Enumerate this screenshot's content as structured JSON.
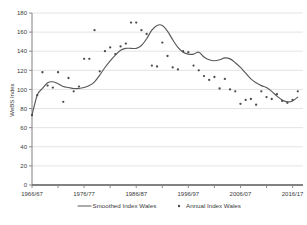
{
  "chart_data": {
    "type": "line",
    "title": "",
    "xlabel": "",
    "ylabel": "WeBS Index",
    "ylim": [
      0,
      180
    ],
    "ytick_values": [
      0,
      20,
      40,
      60,
      80,
      100,
      120,
      140,
      160,
      180
    ],
    "ytick_labels": [
      "0",
      "20",
      "40",
      "60",
      "80",
      "100",
      "120",
      "140",
      "160",
      "180"
    ],
    "xtick_labels": [
      "1966/67",
      "1976/77",
      "1986/87",
      "1996/97",
      "2006/07",
      "2016/17"
    ],
    "xtick_years": [
      1966,
      1976,
      1986,
      1996,
      2006,
      2016
    ],
    "xlim": [
      1966,
      2018
    ],
    "grid": "horizontal",
    "legend_position": "bottom",
    "legend": [
      {
        "label": "Smoothed Index Wales",
        "type": "line",
        "color": "#595959"
      },
      {
        "label": "Annual Index Wales",
        "type": "marker",
        "color": "#4d4d4d"
      }
    ],
    "series": [
      {
        "name": "Smoothed Index Wales",
        "type": "line",
        "x": [
          1966,
          1967,
          1968,
          1969,
          1970,
          1971,
          1972,
          1973,
          1974,
          1975,
          1976,
          1977,
          1978,
          1979,
          1980,
          1981,
          1982,
          1983,
          1984,
          1985,
          1986,
          1987,
          1988,
          1989,
          1990,
          1991,
          1992,
          1993,
          1994,
          1995,
          1996,
          1997,
          1998,
          1999,
          2000,
          2001,
          2002,
          2003,
          2004,
          2005,
          2006,
          2007,
          2008,
          2009,
          2010,
          2011,
          2012,
          2013,
          2014,
          2015,
          2016,
          2017
        ],
        "values": [
          73,
          94,
          101,
          107,
          108,
          106,
          103,
          102,
          101,
          101,
          102,
          104,
          108,
          115,
          123,
          130,
          136,
          141,
          143,
          143,
          143,
          146,
          153,
          162,
          167,
          167,
          161,
          152,
          144,
          139,
          137,
          137,
          139,
          134,
          131,
          130,
          131,
          133,
          132,
          128,
          123,
          117,
          111,
          107,
          104,
          102,
          98,
          93,
          89,
          87,
          88,
          92
        ]
      },
      {
        "name": "Annual Index Wales",
        "type": "scatter",
        "x": [
          1966,
          1967,
          1968,
          1969,
          1970,
          1971,
          1972,
          1973,
          1974,
          1975,
          1976,
          1977,
          1978,
          1979,
          1980,
          1981,
          1982,
          1983,
          1984,
          1985,
          1986,
          1987,
          1988,
          1989,
          1990,
          1991,
          1992,
          1993,
          1994,
          1995,
          1996,
          1997,
          1998,
          1999,
          2000,
          2001,
          2002,
          2003,
          2004,
          2005,
          2006,
          2007,
          2008,
          2009,
          2010,
          2011,
          2012,
          2013,
          2014,
          2015,
          2016,
          2017
        ],
        "values": [
          73,
          94,
          118,
          104,
          102,
          118,
          87,
          112,
          98,
          103,
          132,
          132,
          162,
          119,
          140,
          144,
          137,
          145,
          148,
          170,
          170,
          162,
          158,
          125,
          124,
          149,
          135,
          123,
          121,
          140,
          139,
          125,
          120,
          114,
          110,
          113,
          101,
          111,
          100,
          98,
          85,
          89,
          90,
          84,
          98,
          92,
          90,
          95,
          88,
          86,
          89,
          98
        ]
      }
    ]
  }
}
